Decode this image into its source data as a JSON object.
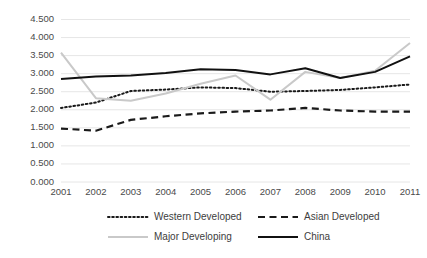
{
  "chart_data": {
    "type": "line",
    "title": "",
    "subtitle": "",
    "xlabel": "",
    "ylabel": "",
    "x": [
      2001,
      2002,
      2003,
      2004,
      2005,
      2006,
      2007,
      2008,
      2009,
      2010,
      2011
    ],
    "categories": [
      "2001",
      "2002",
      "2003",
      "2004",
      "2005",
      "2006",
      "2007",
      "2008",
      "2009",
      "2010",
      "2011"
    ],
    "xlim": [
      2001,
      2011
    ],
    "ylim": [
      0.0,
      4.5
    ],
    "ytick_labels": [
      "0.000",
      "0.500",
      "1.000",
      "1.500",
      "2.000",
      "2.500",
      "3.000",
      "3.500",
      "4.000",
      "4.500"
    ],
    "ytick_values": [
      0.0,
      0.5,
      1.0,
      1.5,
      2.0,
      2.5,
      3.0,
      3.5,
      4.0,
      4.5
    ],
    "grid": true,
    "grid_axis": "y",
    "legend_position": "bottom",
    "series": [
      {
        "name": "Western Developed",
        "style": "dotted",
        "color": "#1a1a1a",
        "values": [
          2.05,
          2.2,
          2.52,
          2.56,
          2.62,
          2.6,
          2.5,
          2.52,
          2.55,
          2.62,
          2.7
        ]
      },
      {
        "name": "Asian Developed",
        "style": "dashed",
        "color": "#1a1a1a",
        "values": [
          1.48,
          1.42,
          1.72,
          1.82,
          1.9,
          1.95,
          1.98,
          2.05,
          1.98,
          1.95,
          1.95
        ]
      },
      {
        "name": "Major Developing",
        "style": "solid",
        "color": "#c9c9c9",
        "values": [
          3.58,
          2.32,
          2.25,
          2.45,
          2.72,
          2.95,
          2.28,
          3.05,
          2.88,
          3.08,
          3.85
        ]
      },
      {
        "name": "China",
        "style": "solid",
        "color": "#111111",
        "values": [
          2.85,
          2.92,
          2.95,
          3.02,
          3.12,
          3.1,
          2.98,
          3.15,
          2.88,
          3.05,
          3.48
        ]
      }
    ]
  },
  "legend": {
    "items": [
      {
        "label": "Western Developed",
        "style": "dotted",
        "color": "#1a1a1a"
      },
      {
        "label": "Asian Developed",
        "style": "dashed",
        "color": "#1a1a1a"
      },
      {
        "label": "Major Developing",
        "style": "solid",
        "color": "#c9c9c9"
      },
      {
        "label": "China",
        "style": "solid",
        "color": "#111111"
      }
    ]
  }
}
